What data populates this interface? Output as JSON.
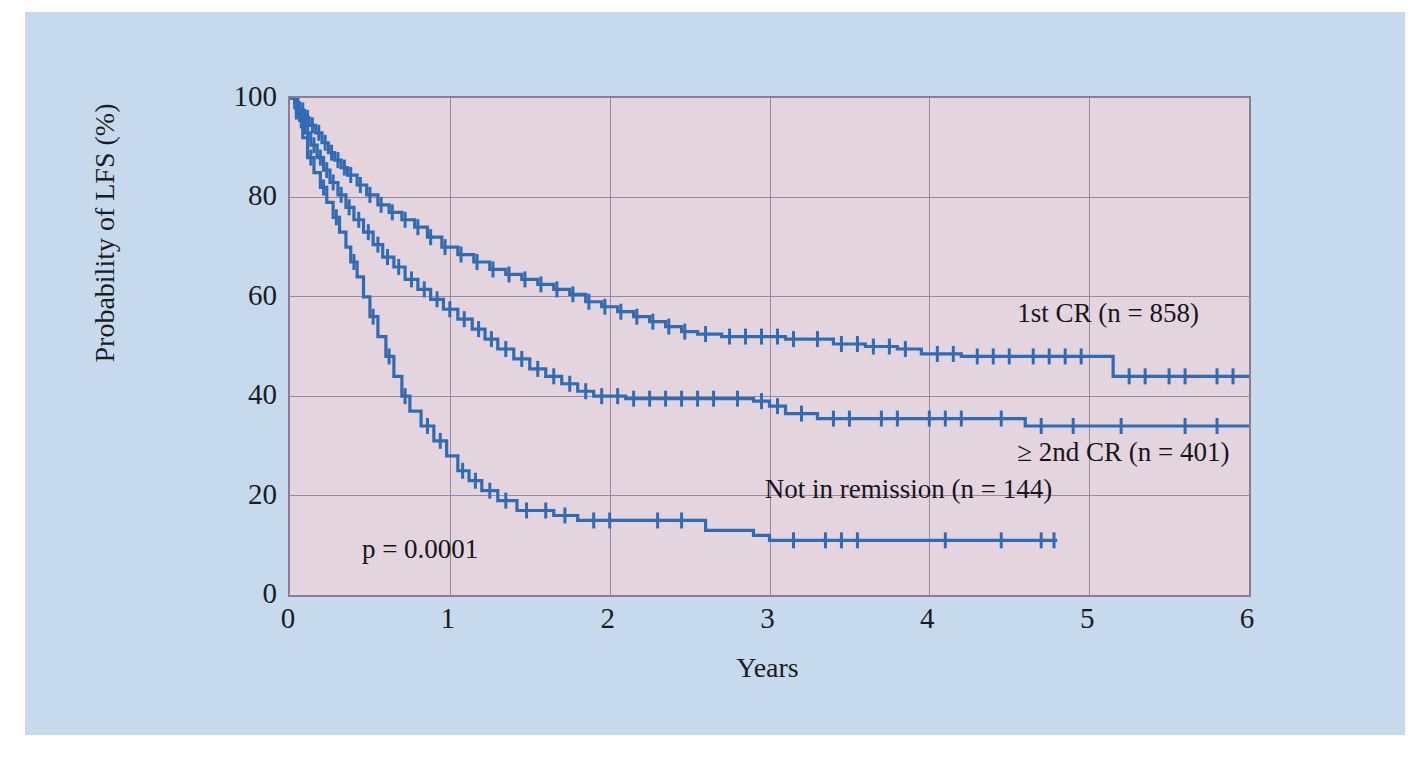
{
  "figure": {
    "background_color": "#c7daed",
    "plot_background_color": "#e3d4de",
    "plot_border_color": "#8f7b97",
    "grid_color": "#9b87a4",
    "curve_color": "#2f6cb5"
  },
  "chart_data": {
    "type": "line",
    "subtype": "kaplan-meier-survival",
    "title": "",
    "xlabel": "Years",
    "ylabel": "Probability of LFS (%)",
    "xlim": [
      0,
      6
    ],
    "ylim": [
      0,
      100
    ],
    "xticks": [
      "0",
      "1",
      "2",
      "3",
      "4",
      "5",
      "6"
    ],
    "yticks": [
      "0",
      "20",
      "40",
      "60",
      "80",
      "100"
    ],
    "grid": true,
    "legend_position": "inline-annotations",
    "annotations": [
      {
        "name": "p-value",
        "text": "p = 0.0001",
        "x": 0.45,
        "y": 8.5
      },
      {
        "name": "curve-label-1st-cr",
        "text": "1st CR (n = 858)",
        "x": 4.55,
        "y": 56
      },
      {
        "name": "curve-label-2nd-cr",
        "text": "≥ 2nd CR (n = 401)",
        "x": 4.55,
        "y": 28
      },
      {
        "name": "curve-label-not-in-remission",
        "text": "Not in remission (n = 144)",
        "x": 2.97,
        "y": 20.5
      }
    ],
    "series": [
      {
        "name": "1st CR (n = 858)",
        "label": "1st CR (n = 858)",
        "n": 858,
        "color": "#2f6cb5",
        "points": [
          [
            0.0,
            100
          ],
          [
            0.03,
            99
          ],
          [
            0.06,
            97.5
          ],
          [
            0.09,
            96
          ],
          [
            0.12,
            94.5
          ],
          [
            0.16,
            93
          ],
          [
            0.2,
            91
          ],
          [
            0.24,
            89
          ],
          [
            0.28,
            87.5
          ],
          [
            0.32,
            86
          ],
          [
            0.36,
            84.5
          ],
          [
            0.42,
            82.5
          ],
          [
            0.48,
            80.5
          ],
          [
            0.55,
            78.5
          ],
          [
            0.62,
            77
          ],
          [
            0.7,
            75.5
          ],
          [
            0.78,
            74
          ],
          [
            0.86,
            72
          ],
          [
            0.95,
            70
          ],
          [
            1.05,
            68.5
          ],
          [
            1.15,
            67
          ],
          [
            1.25,
            65.5
          ],
          [
            1.35,
            64.5
          ],
          [
            1.45,
            63.5
          ],
          [
            1.55,
            62.5
          ],
          [
            1.65,
            61.5
          ],
          [
            1.75,
            60.5
          ],
          [
            1.85,
            59
          ],
          [
            1.95,
            58
          ],
          [
            2.05,
            57
          ],
          [
            2.15,
            56
          ],
          [
            2.25,
            55
          ],
          [
            2.35,
            54
          ],
          [
            2.45,
            53
          ],
          [
            2.55,
            52.5
          ],
          [
            2.7,
            52
          ],
          [
            2.9,
            52
          ],
          [
            3.1,
            51.5
          ],
          [
            3.25,
            51.5
          ],
          [
            3.4,
            50.5
          ],
          [
            3.6,
            50
          ],
          [
            3.8,
            49.5
          ],
          [
            3.95,
            48.5
          ],
          [
            4.2,
            48
          ],
          [
            4.6,
            48
          ],
          [
            5.0,
            48
          ],
          [
            5.15,
            44
          ],
          [
            5.4,
            44
          ],
          [
            5.7,
            44
          ],
          [
            6.0,
            44
          ]
        ],
        "censor_marks": [
          0.05,
          0.08,
          0.11,
          0.14,
          0.18,
          0.22,
          0.26,
          0.3,
          0.34,
          0.38,
          0.44,
          0.5,
          0.57,
          0.64,
          0.72,
          0.8,
          0.88,
          0.97,
          1.07,
          1.17,
          1.27,
          1.37,
          1.47,
          1.57,
          1.67,
          1.77,
          1.87,
          1.97,
          2.07,
          2.17,
          2.27,
          2.37,
          2.47,
          2.6,
          2.75,
          2.85,
          2.95,
          3.05,
          3.15,
          3.3,
          3.45,
          3.55,
          3.65,
          3.75,
          3.85,
          4.05,
          4.15,
          4.3,
          4.4,
          4.5,
          4.65,
          4.75,
          4.85,
          4.95,
          5.25,
          5.35,
          5.5,
          5.6,
          5.8,
          5.9
        ]
      },
      {
        "name": "≥ 2nd CR (n = 401)",
        "label": "≥ 2nd CR (n = 401)",
        "n": 401,
        "color": "#2f6cb5",
        "points": [
          [
            0.0,
            100
          ],
          [
            0.03,
            98
          ],
          [
            0.06,
            95.5
          ],
          [
            0.09,
            93
          ],
          [
            0.13,
            90.5
          ],
          [
            0.17,
            88
          ],
          [
            0.21,
            85.5
          ],
          [
            0.25,
            83
          ],
          [
            0.3,
            80.5
          ],
          [
            0.35,
            78
          ],
          [
            0.4,
            75.5
          ],
          [
            0.46,
            73
          ],
          [
            0.52,
            70.5
          ],
          [
            0.58,
            68
          ],
          [
            0.65,
            66
          ],
          [
            0.72,
            63.5
          ],
          [
            0.8,
            61.5
          ],
          [
            0.88,
            59.5
          ],
          [
            0.96,
            57.5
          ],
          [
            1.05,
            55.5
          ],
          [
            1.14,
            53.5
          ],
          [
            1.22,
            51.5
          ],
          [
            1.3,
            49.5
          ],
          [
            1.4,
            47.5
          ],
          [
            1.5,
            45.5
          ],
          [
            1.6,
            44
          ],
          [
            1.7,
            42.5
          ],
          [
            1.8,
            41
          ],
          [
            1.9,
            40
          ],
          [
            2.1,
            39.5
          ],
          [
            2.4,
            39.5
          ],
          [
            2.7,
            39.5
          ],
          [
            2.9,
            39
          ],
          [
            3.0,
            38
          ],
          [
            3.1,
            36.5
          ],
          [
            3.3,
            35.5
          ],
          [
            3.6,
            35.5
          ],
          [
            3.9,
            35.5
          ],
          [
            4.3,
            35.5
          ],
          [
            4.6,
            34
          ],
          [
            5.0,
            34
          ],
          [
            5.5,
            34
          ],
          [
            6.0,
            34
          ]
        ],
        "censor_marks": [
          0.04,
          0.07,
          0.11,
          0.15,
          0.19,
          0.23,
          0.27,
          0.32,
          0.37,
          0.43,
          0.49,
          0.55,
          0.61,
          0.68,
          0.76,
          0.84,
          0.92,
          1.0,
          1.09,
          1.18,
          1.26,
          1.35,
          1.45,
          1.55,
          1.65,
          1.75,
          1.85,
          1.95,
          2.05,
          2.15,
          2.25,
          2.35,
          2.45,
          2.55,
          2.65,
          2.8,
          2.95,
          3.05,
          3.2,
          3.4,
          3.5,
          3.7,
          3.8,
          4.0,
          4.1,
          4.2,
          4.45,
          4.7,
          4.9,
          5.2,
          5.6,
          5.8
        ]
      },
      {
        "name": "Not in remission (n = 144)",
        "label": "Not in remission (n = 144)",
        "n": 144,
        "color": "#2f6cb5",
        "points": [
          [
            0.0,
            100
          ],
          [
            0.04,
            96
          ],
          [
            0.08,
            92
          ],
          [
            0.11,
            88
          ],
          [
            0.15,
            85
          ],
          [
            0.19,
            82
          ],
          [
            0.23,
            79
          ],
          [
            0.27,
            76
          ],
          [
            0.31,
            73
          ],
          [
            0.35,
            70
          ],
          [
            0.38,
            67
          ],
          [
            0.42,
            64
          ],
          [
            0.46,
            60
          ],
          [
            0.5,
            56
          ],
          [
            0.55,
            52
          ],
          [
            0.6,
            48
          ],
          [
            0.65,
            44
          ],
          [
            0.7,
            40
          ],
          [
            0.75,
            37
          ],
          [
            0.82,
            34
          ],
          [
            0.9,
            31
          ],
          [
            0.98,
            28
          ],
          [
            1.05,
            25
          ],
          [
            1.12,
            23
          ],
          [
            1.2,
            21
          ],
          [
            1.3,
            19
          ],
          [
            1.42,
            17
          ],
          [
            1.55,
            17
          ],
          [
            1.65,
            16
          ],
          [
            1.8,
            15
          ],
          [
            2.2,
            15
          ],
          [
            2.6,
            13
          ],
          [
            2.9,
            12
          ],
          [
            3.0,
            11
          ],
          [
            3.4,
            11
          ],
          [
            3.8,
            11
          ],
          [
            4.2,
            11
          ],
          [
            4.6,
            11
          ],
          [
            4.8,
            11
          ]
        ],
        "censor_marks": [
          0.13,
          0.21,
          0.29,
          0.4,
          0.52,
          0.62,
          0.72,
          0.86,
          0.94,
          1.08,
          1.16,
          1.25,
          1.35,
          1.48,
          1.6,
          1.72,
          1.9,
          2.0,
          2.3,
          2.45,
          3.15,
          3.35,
          3.45,
          3.55,
          4.1,
          4.45,
          4.7,
          4.78
        ]
      }
    ]
  }
}
